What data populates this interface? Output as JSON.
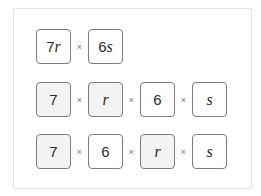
{
  "rows": [
    {
      "terms": [
        {
          "num": "7",
          "var": "r",
          "shaded": false
        },
        {
          "num": "6",
          "var": "s",
          "shaded": false
        }
      ],
      "operator": "×"
    },
    {
      "terms": [
        {
          "num": "7",
          "var": "",
          "shaded": true
        },
        {
          "num": "",
          "var": "r",
          "shaded": true
        },
        {
          "num": "6",
          "var": "",
          "shaded": false
        },
        {
          "num": "",
          "var": "s",
          "shaded": false
        }
      ],
      "operator": "×"
    },
    {
      "terms": [
        {
          "num": "7",
          "var": "",
          "shaded": true
        },
        {
          "num": "6",
          "var": "",
          "shaded": false
        },
        {
          "num": "",
          "var": "r",
          "shaded": true
        },
        {
          "num": "",
          "var": "s",
          "shaded": false
        }
      ],
      "operator": "×"
    }
  ],
  "colors": {
    "border": "#7d7d7d",
    "shaded_fill": "#f3f3f3",
    "frame_border": "#e4e4e4"
  }
}
